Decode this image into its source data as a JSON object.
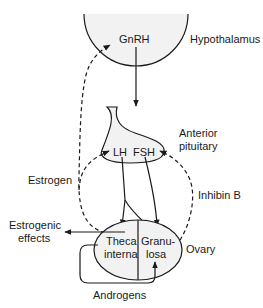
{
  "diagram": {
    "type": "hypothalamic-pituitary-ovarian axis",
    "nodes": {
      "hypothalamus": {
        "label": "Hypothalamus",
        "hormone": "GnRH"
      },
      "pituitary": {
        "label_line1": "Anterior",
        "label_line2": "pituitary",
        "hormones": [
          "LH",
          "FSH"
        ]
      },
      "ovary": {
        "label": "Ovary",
        "theca_line1": "Theca",
        "theca_line2": "interna",
        "granulosa_line1": "Granu-",
        "granulosa_line2": "losa"
      }
    },
    "edges": {
      "estrogen": "Estrogen",
      "inhibin": "Inhibin B",
      "estrogenic_line1": "Estrogenic",
      "estrogenic_line2": "effects",
      "androgens": "Androgens"
    },
    "colors": {
      "line": "#1a1a1a",
      "fill": "#f2f2f2"
    }
  }
}
